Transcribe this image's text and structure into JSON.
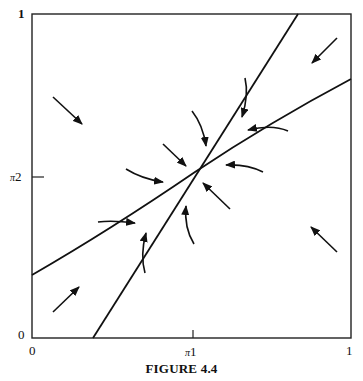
{
  "figure": {
    "caption": "FIGURE 4.4",
    "x_axis": {
      "label_symbol": "π",
      "label_sub": "1",
      "min_label": "0",
      "max_label": "1"
    },
    "y_axis": {
      "label_symbol": "π",
      "label_sub": "2",
      "min_label": "0",
      "max_label": "1"
    }
  },
  "diagram": {
    "type": "phase-portrait",
    "equilibrium": {
      "x_label": "π1",
      "y_label": "π2",
      "description": "stable node at intersection of the two isoclines"
    },
    "isoclines": [
      {
        "name": "steep-line",
        "from": [
          0.19,
          0
        ],
        "to": [
          0.83,
          1
        ]
      },
      {
        "name": "shallow-line",
        "from": [
          0,
          0.19
        ],
        "to": [
          1,
          0.8
        ]
      }
    ],
    "arrow_count": 14
  }
}
